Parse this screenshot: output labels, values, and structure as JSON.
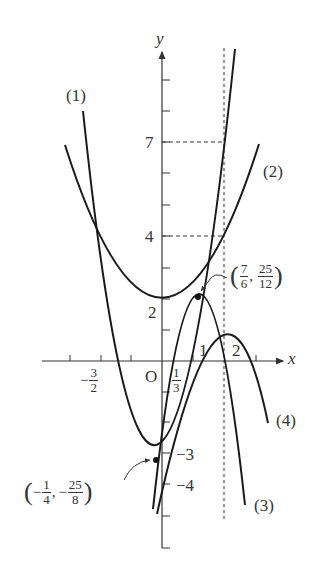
{
  "diagram": {
    "type": "function-graph",
    "axes": {
      "x_label": "x",
      "y_label": "y",
      "origin_label": "O",
      "x_tick_labels": [
        {
          "value": "-3/2",
          "num": "3",
          "den": "2",
          "sign": "−"
        },
        {
          "value": "1/3",
          "num": "1",
          "den": "3",
          "sign": ""
        },
        {
          "value": "1",
          "text": "1"
        },
        {
          "value": "2",
          "text": "2"
        }
      ],
      "y_tick_labels": [
        {
          "value": "7",
          "text": "7"
        },
        {
          "value": "4",
          "text": "4"
        },
        {
          "value": "2",
          "text": "2"
        },
        {
          "value": "-3",
          "text": "−3"
        },
        {
          "value": "-4",
          "text": "−4"
        }
      ]
    },
    "curves": [
      {
        "id": "1",
        "label": "(1)",
        "kind": "parabola-up",
        "vertex": "(-1/4, -25/8)"
      },
      {
        "id": "2",
        "label": "(2)",
        "kind": "parabola-up",
        "vertex": "(0, 2)"
      },
      {
        "id": "3",
        "label": "(3)",
        "kind": "parabola-down",
        "vertex": "(7/6, 25/12)"
      },
      {
        "id": "4",
        "label": "(4)",
        "kind": "parabola-down",
        "vertex": "(2, 0)"
      }
    ],
    "annotations": {
      "vertex_3": {
        "x_num": "7",
        "x_den": "6",
        "y_num": "25",
        "y_den": "12",
        "x_sign": "",
        "y_sign": ""
      },
      "vertex_1": {
        "x_num": "1",
        "x_den": "4",
        "y_num": "25",
        "y_den": "8",
        "x_sign": "−",
        "y_sign": "−"
      }
    },
    "guides": {
      "vertical_dashed_at_x": "2",
      "horizontal_dashed_at_y": [
        "7",
        "4"
      ]
    },
    "colors": {
      "stroke": "#1a1a1a",
      "axis": "#333333",
      "text": "#333333",
      "background": "#ffffff"
    }
  }
}
